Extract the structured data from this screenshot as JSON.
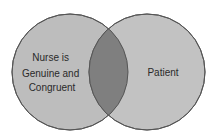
{
  "diagram": {
    "type": "venn",
    "sets": [
      {
        "label_lines": [
          "Nurse is",
          "Genuine and",
          "Congruent"
        ]
      },
      {
        "label_lines": [
          "Patient"
        ]
      }
    ],
    "colors": {
      "circle_fill": "#bdbdbd",
      "overlap_fill": "#7f7f7f",
      "stroke": "#555555",
      "background": "#ffffff"
    }
  }
}
